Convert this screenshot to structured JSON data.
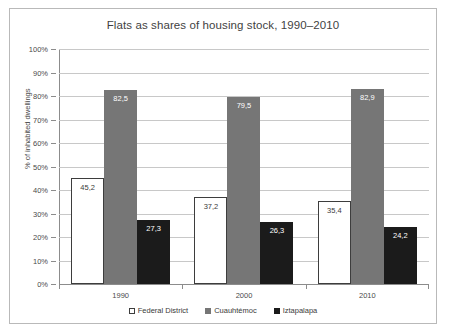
{
  "chart_data": {
    "type": "bar",
    "title": "Flats as shares of housing stock, 1990–2010",
    "xlabel": "",
    "ylabel": "% of inhabited dwellings",
    "categories": [
      "1990",
      "2000",
      "2010"
    ],
    "series": [
      {
        "name": "Federal District",
        "color": "#ffffff",
        "values": [
          45.2,
          37.2,
          35.4
        ],
        "labels": [
          "45,2",
          "37,2",
          "35,4"
        ]
      },
      {
        "name": "Cuauhtémoc",
        "color": "#767676",
        "values": [
          82.5,
          79.5,
          82.9
        ],
        "labels": [
          "82,5",
          "79,5",
          "82,9"
        ]
      },
      {
        "name": "Iztapalapa",
        "color": "#1b1b1b",
        "values": [
          27.3,
          26.3,
          24.2
        ],
        "labels": [
          "27,3",
          "26,3",
          "24,2"
        ]
      }
    ],
    "ylim": [
      0,
      100
    ],
    "yticks": [
      0,
      10,
      20,
      30,
      40,
      50,
      60,
      70,
      80,
      90,
      100
    ],
    "ytick_labels": [
      "0%",
      "10%",
      "20%",
      "30%",
      "40%",
      "50%",
      "60%",
      "70%",
      "80%",
      "90%",
      "100%"
    ],
    "grid": true,
    "legend_position": "bottom"
  }
}
